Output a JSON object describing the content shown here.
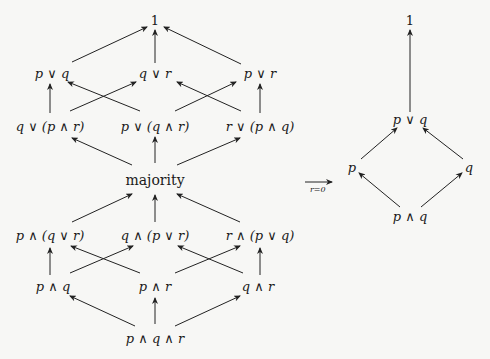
{
  "left_lattice": {
    "top": "1",
    "row1": [
      "p ∨ q",
      "q ∨ r",
      "p ∨ r"
    ],
    "row2": [
      "q ∨ (p ∧ r)",
      "p ∨ (q ∧ r)",
      "r ∨ (p ∧ q)"
    ],
    "middle": "majority",
    "row3": [
      "p ∧ (q ∨ r)",
      "q ∧ (p ∨ r)",
      "r ∧ (p ∨ q)"
    ],
    "row4": [
      "p ∧ q",
      "p ∧ r",
      "q ∧ r"
    ],
    "bottom": "p ∧ q ∧ r"
  },
  "map_arrow": {
    "label": "r=0"
  },
  "right_lattice": {
    "top": "1",
    "upper": "p ∨ q",
    "left": "p",
    "right": "q",
    "bottom": "p ∧ q"
  }
}
